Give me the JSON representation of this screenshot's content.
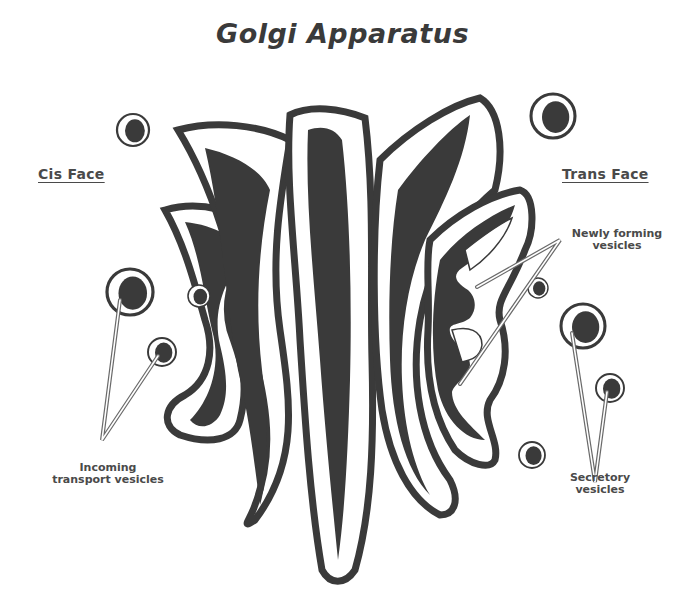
{
  "title": "Golgi Apparatus",
  "labels": {
    "cis_face": "Cis Face",
    "trans_face": "Trans Face",
    "newly_forming": [
      "Newly forming",
      "vesicles"
    ],
    "incoming": [
      "Incoming",
      "transport vesicles"
    ],
    "secretory": [
      "Secretory",
      "vesicles"
    ]
  },
  "colors": {
    "ink": "#3a3a3a",
    "leader": "#7a7a7a",
    "background": "#ffffff"
  }
}
